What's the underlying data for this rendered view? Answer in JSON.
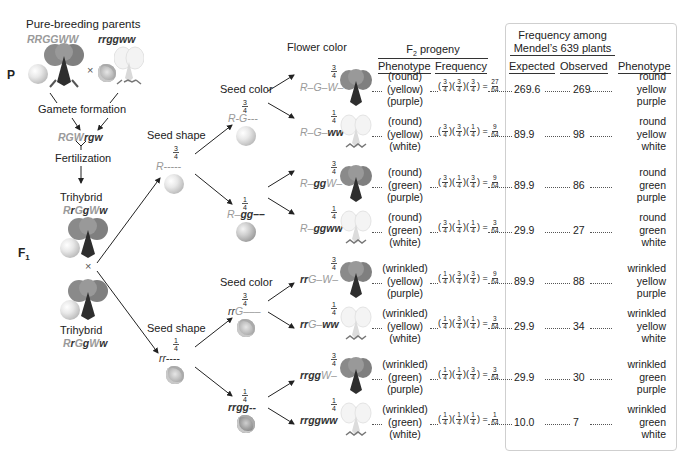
{
  "parents": {
    "title": "Pure-breeding parents",
    "p_label": "P",
    "genotype_1": "RRGGWW",
    "genotype_2": "rrggww",
    "cross": "×",
    "gamete_formation": "Gamete formation",
    "gamete_1": "RGW",
    "gamete_2": "rgw",
    "fertilization": "Fertilization"
  },
  "f1": {
    "label": "F₁",
    "label_main": "F",
    "label_sub": "1",
    "trihybrid_1": "Trihybrid",
    "genotype_1": "RrGgWw",
    "cross": "×",
    "trihybrid_2": "Trihybrid",
    "genotype_2": "RrGgWw"
  },
  "branches": {
    "seed_shape_label_top": "Seed shape",
    "seed_shape_label_bottom": "Seed shape",
    "seed_color_label_top": "Seed color",
    "seed_color_label_bottom": "Seed color",
    "flower_color_label": "Flower color",
    "shape": [
      {
        "genotype": "R-----",
        "prob_num": "3",
        "prob_den": "4",
        "seed": "round"
      },
      {
        "genotype": "rr----",
        "prob_num": "1",
        "prob_den": "4",
        "seed": "wrinkled"
      }
    ],
    "color": [
      {
        "genotype": "R-G---",
        "prob_num": "3",
        "prob_den": "4",
        "seed": "round-yellow"
      },
      {
        "genotype": "R-gg--",
        "prob_num": "1",
        "prob_den": "4",
        "seed": "round-green"
      },
      {
        "genotype": "rrG---",
        "prob_num": "3",
        "prob_den": "4",
        "seed": "wrinkled-yellow"
      },
      {
        "genotype": "rrgg--",
        "prob_num": "1",
        "prob_den": "4",
        "seed": "wrinkled-green"
      }
    ]
  },
  "table": {
    "f2_header": "F₂ progeny",
    "f2_header_main": "F",
    "f2_header_sub": "2",
    "f2_header_rest": " progeny",
    "col_phenotype": "Phenotype",
    "col_frequency": "Frequency",
    "mendel_header_line1": "Frequency among",
    "mendel_header_line2": "Mendel’s 639 plants",
    "col_expected": "Expected",
    "col_observed": "Observed",
    "col_phenotype_right": "Phenotype"
  },
  "rows": [
    {
      "genotype": "R-G-W-",
      "prob_num": "3",
      "prob_den": "4",
      "flower": "purple",
      "pheno": [
        "(round)",
        "(yellow)",
        "(purple)"
      ],
      "f": [
        "3",
        "4",
        "3",
        "4",
        "3",
        "4"
      ],
      "result_num": "27",
      "result_den": "64",
      "expected": "269.6",
      "observed": "269",
      "pheno_r": [
        "round",
        "yellow",
        "purple"
      ]
    },
    {
      "genotype": "R-G-ww",
      "prob_num": "1",
      "prob_den": "4",
      "flower": "white",
      "pheno": [
        "(round)",
        "(yellow)",
        "(white)"
      ],
      "f": [
        "3",
        "4",
        "3",
        "4",
        "1",
        "4"
      ],
      "result_num": "9",
      "result_den": "64",
      "expected": "89.9",
      "observed": "98",
      "pheno_r": [
        "round",
        "yellow",
        "white"
      ]
    },
    {
      "genotype": "R-ggW-",
      "prob_num": "3",
      "prob_den": "4",
      "flower": "purple",
      "pheno": [
        "(round)",
        "(green)",
        "(purple)"
      ],
      "f": [
        "3",
        "4",
        "1",
        "4",
        "3",
        "4"
      ],
      "result_num": "9",
      "result_den": "64",
      "expected": "89.9",
      "observed": "86",
      "pheno_r": [
        "round",
        "green",
        "purple"
      ]
    },
    {
      "genotype": "R-ggww",
      "prob_num": "1",
      "prob_den": "4",
      "flower": "white",
      "pheno": [
        "(round)",
        "(green)",
        "(white)"
      ],
      "f": [
        "3",
        "4",
        "1",
        "4",
        "1",
        "4"
      ],
      "result_num": "3",
      "result_den": "64",
      "expected": "29.9",
      "observed": "27",
      "pheno_r": [
        "round",
        "green",
        "white"
      ]
    },
    {
      "genotype": "rrG-W-",
      "prob_num": "3",
      "prob_den": "4",
      "flower": "purple",
      "pheno": [
        "(wrinkled)",
        "(yellow)",
        "(purple)"
      ],
      "f": [
        "1",
        "4",
        "3",
        "4",
        "3",
        "4"
      ],
      "result_num": "9",
      "result_den": "64",
      "expected": "89.9",
      "observed": "88",
      "pheno_r": [
        "wrinkled",
        "yellow",
        "purple"
      ]
    },
    {
      "genotype": "rrG-ww",
      "prob_num": "1",
      "prob_den": "4",
      "flower": "white",
      "pheno": [
        "(wrinkled)",
        "(yellow)",
        "(white)"
      ],
      "f": [
        "1",
        "4",
        "3",
        "4",
        "1",
        "4"
      ],
      "result_num": "3",
      "result_den": "64",
      "expected": "29.9",
      "observed": "34",
      "pheno_r": [
        "wrinkled",
        "yellow",
        "white"
      ]
    },
    {
      "genotype": "rrggW-",
      "prob_num": "3",
      "prob_den": "4",
      "flower": "purple",
      "pheno": [
        "(wrinkled)",
        "(green)",
        "(purple)"
      ],
      "f": [
        "1",
        "4",
        "1",
        "4",
        "3",
        "4"
      ],
      "result_num": "3",
      "result_den": "64",
      "expected": "29.9",
      "observed": "30",
      "pheno_r": [
        "wrinkled",
        "green",
        "purple"
      ]
    },
    {
      "genotype": "rrggww",
      "prob_num": "1",
      "prob_den": "4",
      "flower": "white",
      "pheno": [
        "(wrinkled)",
        "(green)",
        "(white)"
      ],
      "f": [
        "1",
        "4",
        "1",
        "4",
        "1",
        "4"
      ],
      "result_num": "1",
      "result_den": "64",
      "expected": "10.0",
      "observed": "7",
      "pheno_r": [
        "wrinkled",
        "green",
        "white"
      ]
    }
  ],
  "colors": {
    "dominant_allele": "#9a9a9a",
    "recessive_allele": "#333333",
    "text": "#222222",
    "box_border": "#cfcfcf"
  }
}
